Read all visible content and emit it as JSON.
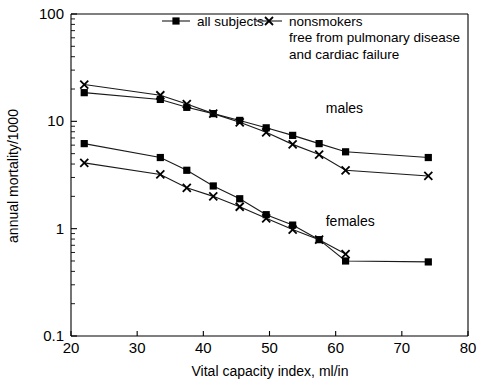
{
  "chart_data": {
    "type": "line",
    "title": "",
    "xlabel": "Vital capacity index, ml/in",
    "ylabel": "annual mortality/1000",
    "xlim": [
      20,
      80
    ],
    "ylim": [
      0.1,
      100
    ],
    "yscale": "log",
    "xscale": "linear",
    "grid": false,
    "legend_position": "top",
    "xticks": [
      20,
      30,
      40,
      50,
      60,
      70,
      80
    ],
    "xtick_labels": [
      "20",
      "30",
      "40",
      "50",
      "60",
      "70",
      "80"
    ],
    "yticks": [
      0.1,
      1,
      10,
      100
    ],
    "ytick_labels": [
      "0.1",
      "1",
      "10",
      "100"
    ],
    "legend": [
      {
        "label": "all subjects",
        "marker": "square"
      },
      {
        "label": "nonsmokers",
        "marker": "x"
      }
    ],
    "legend_sublines": [
      "free from pulmonary disease",
      "and cardiac failure"
    ],
    "annotations": [
      {
        "text": "males",
        "x": 58.5,
        "y": 12.0
      },
      {
        "text": "females",
        "x": 58.5,
        "y": 1.05
      }
    ],
    "series": [
      {
        "name": "males - all subjects",
        "group": "males",
        "marker": "square",
        "x": [
          22,
          33.5,
          37.5,
          41.5,
          45.5,
          49.5,
          53.5,
          57.5,
          61.5,
          74
        ],
        "values": [
          18.5,
          16.0,
          13.5,
          11.8,
          10.2,
          8.7,
          7.4,
          6.2,
          5.2,
          4.6
        ]
      },
      {
        "name": "males - nonsmokers",
        "group": "males",
        "marker": "x",
        "x": [
          22,
          33.5,
          37.5,
          41.5,
          45.5,
          49.5,
          53.5,
          57.5,
          61.5,
          74
        ],
        "values": [
          22.0,
          17.5,
          14.5,
          11.8,
          9.8,
          7.9,
          6.1,
          4.9,
          3.5,
          3.1
        ]
      },
      {
        "name": "females - all subjects",
        "group": "females",
        "marker": "square",
        "x": [
          22,
          33.5,
          37.5,
          41.5,
          45.5,
          49.5,
          53.5,
          57.5,
          61.5,
          74
        ],
        "values": [
          6.2,
          4.6,
          3.5,
          2.5,
          1.9,
          1.35,
          1.08,
          0.79,
          0.5,
          0.49
        ]
      },
      {
        "name": "females - nonsmokers",
        "group": "females",
        "marker": "x",
        "x": [
          22,
          33.5,
          37.5,
          41.5,
          45.5,
          49.5,
          53.5,
          57.5,
          61.5,
          74
        ],
        "values": [
          4.1,
          3.2,
          2.4,
          2.0,
          1.6,
          1.25,
          0.98,
          0.79,
          0.58,
          null
        ]
      }
    ]
  },
  "axes": {
    "x_title": "Vital capacity index, ml/in",
    "y_title": "annual mortality/1000"
  },
  "legend": {
    "entry_1": "all subjects",
    "entry_2": "nonsmokers",
    "subline_1": "free from pulmonary disease",
    "subline_2": "and cardiac failure"
  },
  "annotations": {
    "males": "males",
    "females": "females"
  },
  "ticks": {
    "x": [
      "20",
      "30",
      "40",
      "50",
      "60",
      "70",
      "80"
    ],
    "y": [
      "100",
      "10",
      "1",
      "0.1"
    ]
  },
  "colors": {
    "line": "#1a1a1a",
    "marker": "#000000",
    "axis": "#000000",
    "background": "#ffffff"
  }
}
